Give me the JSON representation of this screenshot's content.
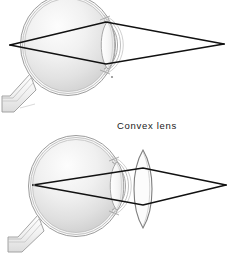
{
  "figure": {
    "background_color": "#ffffff",
    "ray_color": "#111111",
    "outline_color": "#8a8a8a",
    "interior_light": "#f4f4f4",
    "interior_dark": "#d2d2d2",
    "label": {
      "text": "Convex lens",
      "x": 117,
      "y": 129
    }
  },
  "panels": [
    {
      "name": "uncorrected-eye",
      "caption": "",
      "eye": {
        "center_x": 68,
        "center_y": 45,
        "radius_x": 45,
        "radius_y": 48,
        "wall_layers": 3,
        "optic_nerve": {
          "from_x": 30,
          "from_y": 80,
          "to_x": 2,
          "to_y": 108
        },
        "crystalline_lens": {
          "center_x": 108,
          "center_y": 45,
          "half_height": 24,
          "bulge": 9
        },
        "cornea": {
          "center_x": 118,
          "center_y": 45,
          "half_height": 26,
          "bulge": 14
        }
      },
      "rays": {
        "left_focus_x": 10,
        "left_focus_y": 45,
        "right_focus_x": 224,
        "right_focus_y": 44,
        "crossing_x": 106,
        "upper_y": 22,
        "lower_y": 64,
        "description": "Rays converge at a point inside the eye and diverge to a far point"
      },
      "external_lens": null
    },
    {
      "name": "corrected-eye-with-convex-lens",
      "caption": "Convex lens",
      "eye": {
        "center_x": 76,
        "center_y": 186,
        "radius_x": 45,
        "radius_y": 48,
        "wall_layers": 3,
        "optic_nerve": {
          "from_x": 38,
          "from_y": 221,
          "to_x": 8,
          "to_y": 248
        },
        "crystalline_lens": {
          "center_x": 117,
          "center_y": 186,
          "half_height": 24,
          "bulge": 9
        },
        "cornea": {
          "center_x": 127,
          "center_y": 186,
          "half_height": 26,
          "bulge": 14
        }
      },
      "rays": {
        "left_focus_x": 33,
        "left_focus_y": 185,
        "right_focus_x": 226,
        "right_focus_y": 185,
        "crossing_x": 143,
        "upper_y": 168,
        "lower_y": 205,
        "description": "Convex lens bends rays so they focus on the retina"
      },
      "external_lens": {
        "center_x": 143,
        "center_y": 189,
        "half_height": 39,
        "bulge": 11
      }
    }
  ]
}
